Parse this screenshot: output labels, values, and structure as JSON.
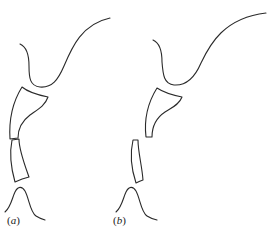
{
  "figure": {
    "stroke_color": "#2a2a2a",
    "background": "#ffffff",
    "panels": [
      {
        "id": "a",
        "label_open": "(",
        "label_letter": "a",
        "label_close": ")",
        "shapes": [
          "top-curve",
          "upper-block",
          "lower-block",
          "bell-curve"
        ]
      },
      {
        "id": "b",
        "label_open": "(",
        "label_letter": "b",
        "label_close": ")",
        "shapes": [
          "top-curve",
          "upper-block",
          "lower-block",
          "bell-curve"
        ]
      }
    ]
  }
}
